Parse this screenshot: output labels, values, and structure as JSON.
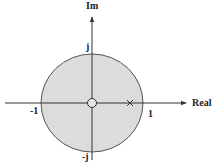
{
  "diagram": {
    "type": "pole-zero plot",
    "axes": {
      "x_label": "Real",
      "y_label": "Im"
    },
    "unit_circle": {
      "fill": "#dcdcdc",
      "stroke": "#555555",
      "labels": {
        "right": "1",
        "left": "-1",
        "top": "j",
        "bottom": "-j"
      }
    },
    "zeros": [
      {
        "re": 0,
        "im": 0,
        "symbol": "o"
      }
    ],
    "poles": [
      {
        "re": 0.75,
        "im": 0,
        "symbol": "x"
      }
    ]
  }
}
